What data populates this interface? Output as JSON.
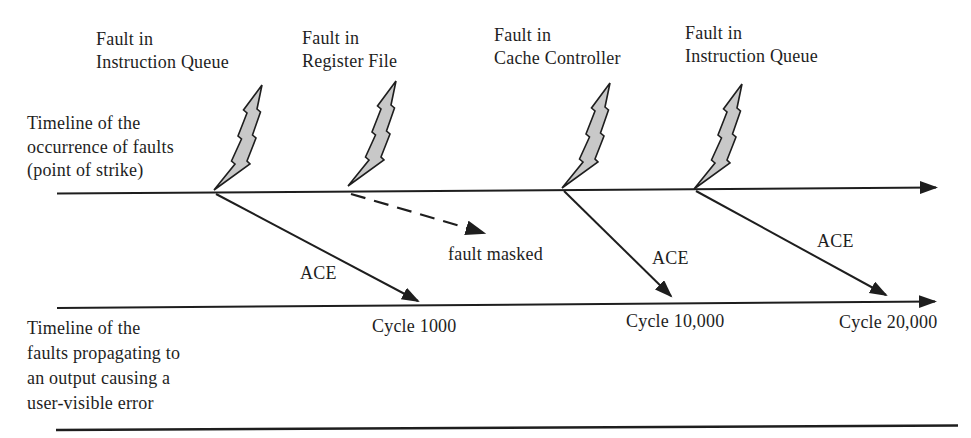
{
  "figure": {
    "colors": {
      "ink": "#1e1e1e",
      "bolt_fill": "#c8c8c8",
      "background": "#ffffff"
    },
    "timelines": {
      "origin_label": "Timeline of the\noccurrence of faults\n(point of strike)",
      "propagation_label": "Timeline of the\nfaults propagating to\nan output causing a\nuser-visible error"
    },
    "fault_labels": [
      "Fault in\nInstruction Queue",
      "Fault in\nRegister File",
      "Fault in\nCache Controller",
      "Fault in\nInstruction Queue"
    ],
    "arrow_labels": {
      "ace": [
        "ACE",
        "ACE",
        "ACE"
      ],
      "masked": "fault masked"
    },
    "cycle_labels": [
      "Cycle 1000",
      "Cycle 10,000",
      "Cycle 20,000"
    ]
  }
}
